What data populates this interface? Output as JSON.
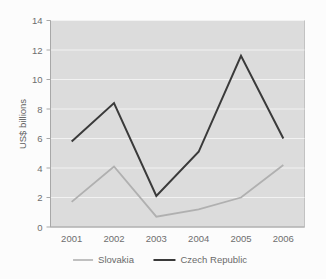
{
  "chart_data": {
    "type": "line",
    "title": "",
    "subtitle": "",
    "xlabel": "",
    "ylabel": "US$ billions",
    "categories": [
      "2001",
      "2002",
      "2003",
      "2004",
      "2005",
      "2006"
    ],
    "x": [
      2001,
      2002,
      2003,
      2004,
      2005,
      2006
    ],
    "series": [
      {
        "name": "Slovakia",
        "color": "#b0b0b0",
        "values": [
          1.7,
          4.1,
          0.7,
          1.2,
          2.0,
          4.2
        ]
      },
      {
        "name": "Czech Republic",
        "color": "#3a3a3a",
        "values": [
          5.8,
          8.4,
          2.1,
          5.1,
          11.6,
          6.0
        ]
      }
    ],
    "ylim": [
      0,
      14
    ],
    "yticks": [
      0,
      2,
      4,
      6,
      8,
      10,
      12,
      14
    ],
    "ytick_labels": [
      "0",
      "2",
      "4",
      "6",
      "8",
      "10",
      "12",
      "14"
    ],
    "grid": true,
    "grid_axis": "y",
    "legend_position": "bottom",
    "plot_background": "#dcdcdc",
    "figure_background": "#fcfcfc",
    "gridline_color": "#f2f2f2",
    "axis_color": "#a8a8a8",
    "tick_label_color": "#6e6e6e"
  },
  "legend": {
    "items": [
      {
        "label": "Slovakia",
        "color": "#b0b0b0",
        "width": 1.6
      },
      {
        "label": "Czech Republic",
        "color": "#3a3a3a",
        "width": 2.0
      }
    ]
  },
  "axes": {
    "y_title": "US$ billions",
    "y_labels": [
      "14",
      "12",
      "10",
      "8",
      "6",
      "4",
      "2",
      "0"
    ],
    "x_labels": [
      "2001",
      "2002",
      "2003",
      "2004",
      "2005",
      "2006"
    ]
  }
}
